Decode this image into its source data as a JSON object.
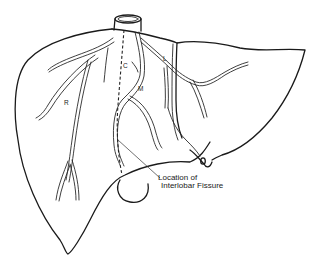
{
  "figure": {
    "labels": {
      "right_vein": "R",
      "middle_vein": "M",
      "left_vein": "L",
      "caudate": "C"
    },
    "annotation": {
      "line1": "Location of",
      "line2": "Interlobar Fissure"
    },
    "colors": {
      "ink": "#1a1a1a",
      "background": "#ffffff"
    }
  }
}
